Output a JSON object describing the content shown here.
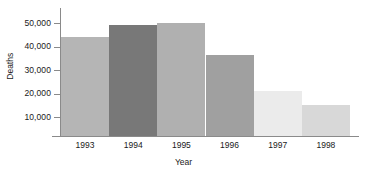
{
  "chart_data": {
    "type": "bar",
    "title": "",
    "xlabel": "Year",
    "ylabel": "Deaths",
    "categories": [
      "1993",
      "1994",
      "1995",
      "1996",
      "1997",
      "1998"
    ],
    "values": [
      44000,
      49000,
      49800,
      36500,
      21000,
      15300
    ],
    "bar_colors": [
      "#b5b5b5",
      "#787878",
      "#b0b0b0",
      "#a0a0a0",
      "#ebebeb",
      "#d8d8d8"
    ],
    "ylim": [
      0,
      53000
    ],
    "ytick_labels": [
      "50,000",
      "40,000",
      "30,000",
      "20,000",
      "10,000"
    ],
    "ytick_values": [
      50000,
      40000,
      30000,
      20000,
      10000
    ],
    "grid": false,
    "legend": "none",
    "bars_contiguous": true,
    "series": [
      {
        "name": "Deaths",
        "points": [
          {
            "category": "1993",
            "value": 44000,
            "color": "#b5b5b5"
          },
          {
            "category": "1994",
            "value": 49000,
            "color": "#787878"
          },
          {
            "category": "1995",
            "value": 49800,
            "color": "#b0b0b0"
          },
          {
            "category": "1996",
            "value": 36500,
            "color": "#a0a0a0"
          },
          {
            "category": "1997",
            "value": 21000,
            "color": "#ebebeb"
          },
          {
            "category": "1998",
            "value": 15300,
            "color": "#d8d8d8"
          }
        ]
      }
    ]
  },
  "style": {
    "background": "#ffffff",
    "axis_color": "#8a8a8a",
    "text_color": "#1a1a1a"
  }
}
